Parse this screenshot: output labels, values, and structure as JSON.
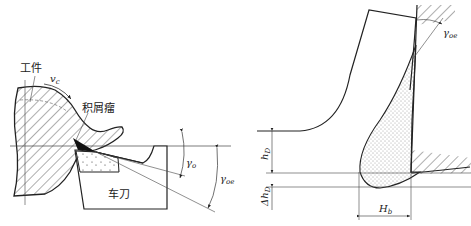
{
  "left_figure": {
    "workpiece_label": "工件",
    "velocity_label": "v",
    "velocity_sub": "c",
    "bue_label": "积屑瘤",
    "tool_label": "车刀",
    "rake_angle_label": "γ",
    "rake_angle_sub": "o",
    "actual_rake_label": "γ",
    "actual_rake_sub": "oe"
  },
  "right_figure": {
    "actual_rake_label": "γ",
    "actual_rake_sub": "oe",
    "cut_thickness_label": "h",
    "cut_thickness_sub": "D",
    "delta_thickness_label": "Δh",
    "delta_thickness_sub": "D",
    "bue_height_label": "H",
    "bue_height_sub": "b"
  },
  "colors": {
    "line": "#222222",
    "background": "#ffffff"
  }
}
